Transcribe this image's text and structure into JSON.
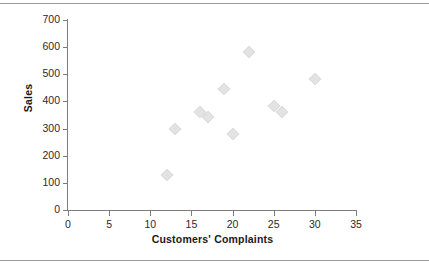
{
  "chart_data": {
    "type": "scatter",
    "title": "",
    "xlabel": "Customers' Complaints",
    "ylabel": "Sales",
    "xlim": [
      0,
      35
    ],
    "ylim": [
      0,
      700
    ],
    "xticks": [
      0,
      5,
      10,
      15,
      20,
      25,
      30,
      35
    ],
    "yticks": [
      0,
      100,
      200,
      300,
      400,
      500,
      600,
      700
    ],
    "grid": false,
    "legend": false,
    "marker_shape": "diamond",
    "marker_color": "#e3e3e3",
    "points": [
      {
        "x": 12,
        "y": 130
      },
      {
        "x": 13,
        "y": 300
      },
      {
        "x": 16,
        "y": 360
      },
      {
        "x": 17,
        "y": 343
      },
      {
        "x": 19,
        "y": 445
      },
      {
        "x": 20,
        "y": 280
      },
      {
        "x": 22,
        "y": 583
      },
      {
        "x": 25,
        "y": 385
      },
      {
        "x": 26,
        "y": 362
      },
      {
        "x": 30,
        "y": 483
      }
    ],
    "series": [
      {
        "name": "Sales vs Customers' Complaints",
        "x": [
          12,
          13,
          16,
          17,
          19,
          20,
          22,
          25,
          26,
          30
        ],
        "values": [
          130,
          300,
          360,
          343,
          445,
          280,
          583,
          385,
          362,
          483
        ]
      }
    ]
  },
  "axes": {
    "y_title": "Sales",
    "x_title": "Customers' Complaints",
    "y_tick_labels": [
      "700",
      "600",
      "500",
      "400",
      "300",
      "200",
      "100",
      "0"
    ],
    "x_tick_labels": [
      "0",
      "5",
      "10",
      "15",
      "20",
      "25",
      "30",
      "35"
    ]
  }
}
